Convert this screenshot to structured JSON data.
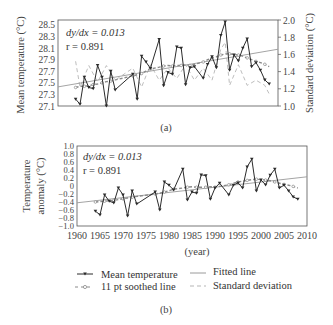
{
  "chart_data": [
    {
      "panel": "a",
      "type": "line",
      "caption": "(a)",
      "ylabel": "Mean temperature (°C)",
      "y2label": "Standard deviation (°C)",
      "xlim": [
        1960,
        2010
      ],
      "ylim": [
        27.1,
        28.55
      ],
      "y2lim": [
        1.0,
        2.0
      ],
      "yticks": [
        "28.5",
        "28.3",
        "28.1",
        "27.9",
        "27.7",
        "27.5",
        "27.3",
        "27.1"
      ],
      "yticks_values": [
        28.5,
        28.3,
        28.1,
        27.9,
        27.7,
        27.5,
        27.3,
        27.1
      ],
      "y2ticks": [
        "2.0",
        "1.8",
        "1.6",
        "1.4",
        "1.2",
        "1.0"
      ],
      "y2ticks_values": [
        2.0,
        1.8,
        1.6,
        1.4,
        1.2,
        1.0
      ],
      "annotation": {
        "slope_label": "dy/dx = 0.013",
        "r_label": "r = 0.891"
      },
      "grid": false,
      "series": [
        {
          "name": "Mean temperature",
          "years": [
            1964,
            1965,
            1966,
            1967,
            1968,
            1969,
            1970,
            1971,
            1972,
            1973,
            1977,
            1978,
            1979,
            1980,
            1981,
            1983,
            1984,
            1985,
            1986,
            1987,
            1988,
            1989,
            1990,
            1991,
            1993,
            1994,
            1995,
            1996,
            1997,
            1998,
            1999,
            2000,
            2001,
            2002,
            2003,
            2004,
            2005,
            2006,
            2007,
            2008
          ],
          "values": [
            27.22,
            27.13,
            27.6,
            27.42,
            27.4,
            27.8,
            27.6,
            27.1,
            27.7,
            27.38,
            27.65,
            27.22,
            27.96,
            27.86,
            27.75,
            28.25,
            27.45,
            27.68,
            27.65,
            28.12,
            28.1,
            27.47,
            27.76,
            27.78,
            27.58,
            27.82,
            27.95,
            27.76,
            28.32,
            28.55,
            27.72,
            27.98,
            27.88,
            28.1,
            28.26,
            27.78,
            27.85,
            27.72,
            27.55,
            27.48
          ]
        },
        {
          "name": "11 pt soothed line",
          "years": [
            1964,
            1965,
            1966,
            1967,
            1968,
            1969,
            1970,
            1971,
            1972,
            1973,
            1977,
            1978,
            1979,
            1980,
            1981,
            1983,
            1984,
            1985,
            1986,
            1987,
            1988,
            1989,
            1990,
            1991,
            1993,
            1994,
            1995,
            1996,
            1997,
            1998,
            1999,
            2000,
            2001,
            2002,
            2003,
            2004,
            2005,
            2006,
            2007,
            2008
          ],
          "values": [
            27.42,
            27.44,
            27.44,
            27.45,
            27.47,
            27.48,
            27.5,
            27.52,
            27.53,
            27.55,
            27.62,
            27.64,
            27.66,
            27.7,
            27.74,
            27.77,
            27.79,
            27.8,
            27.79,
            27.8,
            27.8,
            27.81,
            27.8,
            27.82,
            27.86,
            27.9,
            27.93,
            27.95,
            27.98,
            28.0,
            28.0,
            27.99,
            27.98,
            27.96,
            27.93,
            27.9,
            27.87,
            27.85,
            27.82,
            27.78
          ]
        },
        {
          "name": "Fitted line",
          "x": [
            1960,
            2010
          ],
          "values": [
            27.43,
            28.08
          ]
        },
        {
          "name": "Standard deviation",
          "axis": "right",
          "years": [
            1964,
            1965,
            1967,
            1969,
            1971,
            1973,
            1977,
            1979,
            1981,
            1983,
            1985,
            1987,
            1989,
            1991,
            1993,
            1995,
            1997,
            1998,
            1999,
            2001,
            2003,
            2005,
            2007,
            2008
          ],
          "values": [
            1.52,
            1.22,
            1.47,
            1.28,
            1.47,
            1.3,
            1.44,
            1.22,
            1.48,
            1.3,
            1.44,
            1.32,
            1.48,
            1.3,
            1.44,
            1.3,
            1.66,
            1.74,
            1.24,
            1.48,
            1.24,
            1.3,
            1.24,
            1.14
          ]
        }
      ]
    },
    {
      "panel": "b",
      "type": "line",
      "caption": "(b)",
      "xlabel": "(year)",
      "ylabel_line1": "Temperature",
      "ylabel_line2": "anomaly (°C)",
      "xlim": [
        1960,
        2010
      ],
      "ylim": [
        -1.0,
        1.0
      ],
      "xticks": [
        "1960",
        "1965",
        "1970",
        "1975",
        "1980",
        "1985",
        "1990",
        "1995",
        "2000",
        "2005",
        "2010"
      ],
      "xticks_values": [
        1960,
        1965,
        1970,
        1975,
        1980,
        1985,
        1990,
        1995,
        2000,
        2005,
        2010
      ],
      "yticks": [
        "1.0",
        "0.8",
        "0.6",
        "0.4",
        "0.2",
        "0",
        "−0.2",
        "−0.4",
        "−0.6",
        "−0.8",
        "−1.0"
      ],
      "yticks_values": [
        1.0,
        0.8,
        0.6,
        0.4,
        0.2,
        0,
        -0.2,
        -0.4,
        -0.6,
        -0.8,
        -1.0
      ],
      "annotation": {
        "slope_label": "dy/dx = 0.013",
        "r_label": "r = 0.891"
      },
      "grid": false,
      "series": [
        {
          "name": "Mean temperature",
          "years": [
            1964,
            1965,
            1966,
            1967,
            1968,
            1969,
            1970,
            1971,
            1972,
            1973,
            1977,
            1978,
            1979,
            1980,
            1981,
            1983,
            1984,
            1985,
            1986,
            1987,
            1988,
            1989,
            1990,
            1991,
            1993,
            1994,
            1995,
            1996,
            1997,
            1998,
            1999,
            2000,
            2001,
            2002,
            2003,
            2004,
            2005,
            2006,
            2007,
            2008
          ],
          "values": [
            -0.63,
            -0.72,
            -0.22,
            -0.38,
            -0.42,
            -0.05,
            -0.22,
            -0.75,
            -0.12,
            -0.45,
            -0.15,
            -0.6,
            0.1,
            0.02,
            -0.1,
            0.42,
            -0.35,
            -0.15,
            -0.18,
            0.28,
            0.26,
            -0.33,
            -0.05,
            0.07,
            -0.22,
            0.02,
            0.08,
            -0.05,
            0.48,
            0.67,
            -0.12,
            0.15,
            0.03,
            0.27,
            0.42,
            -0.05,
            0.02,
            -0.12,
            -0.27,
            -0.33
          ]
        },
        {
          "name": "11 pt soothed line",
          "years": [
            1964,
            1965,
            1966,
            1967,
            1968,
            1969,
            1970,
            1971,
            1972,
            1973,
            1977,
            1978,
            1979,
            1980,
            1981,
            1983,
            1984,
            1985,
            1986,
            1987,
            1988,
            1989,
            1990,
            1991,
            1993,
            1994,
            1995,
            1996,
            1997,
            1998,
            1999,
            2000,
            2001,
            2002,
            2003,
            2004,
            2005,
            2006,
            2007,
            2008
          ],
          "values": [
            -0.4,
            -0.39,
            -0.38,
            -0.37,
            -0.36,
            -0.34,
            -0.32,
            -0.3,
            -0.28,
            -0.26,
            -0.2,
            -0.18,
            -0.15,
            -0.12,
            -0.08,
            -0.05,
            -0.03,
            -0.02,
            -0.03,
            -0.03,
            -0.03,
            -0.02,
            -0.03,
            -0.01,
            0.03,
            0.07,
            0.1,
            0.12,
            0.14,
            0.16,
            0.17,
            0.16,
            0.15,
            0.13,
            0.1,
            0.07,
            0.04,
            0.02,
            -0.01,
            -0.05
          ]
        },
        {
          "name": "Fitted line",
          "x": [
            1960,
            2010
          ],
          "values": [
            -0.42,
            0.23
          ]
        }
      ]
    }
  ],
  "legend": {
    "placement": "bottom",
    "items": [
      {
        "label": "Mean temperature",
        "style": "solid-with-markers"
      },
      {
        "label": "Fitted line",
        "style": "solid-light"
      },
      {
        "label": "11 pt soothed line",
        "style": "dashed-with-circles"
      },
      {
        "label": "Standard deviation",
        "style": "dashed-light"
      }
    ]
  },
  "colors": {
    "mean": "#2b2b2b",
    "smooth": "#8a8a8a",
    "fit": "#9a9a9a",
    "sd": "#b5b5b5",
    "axis": "#444444"
  }
}
